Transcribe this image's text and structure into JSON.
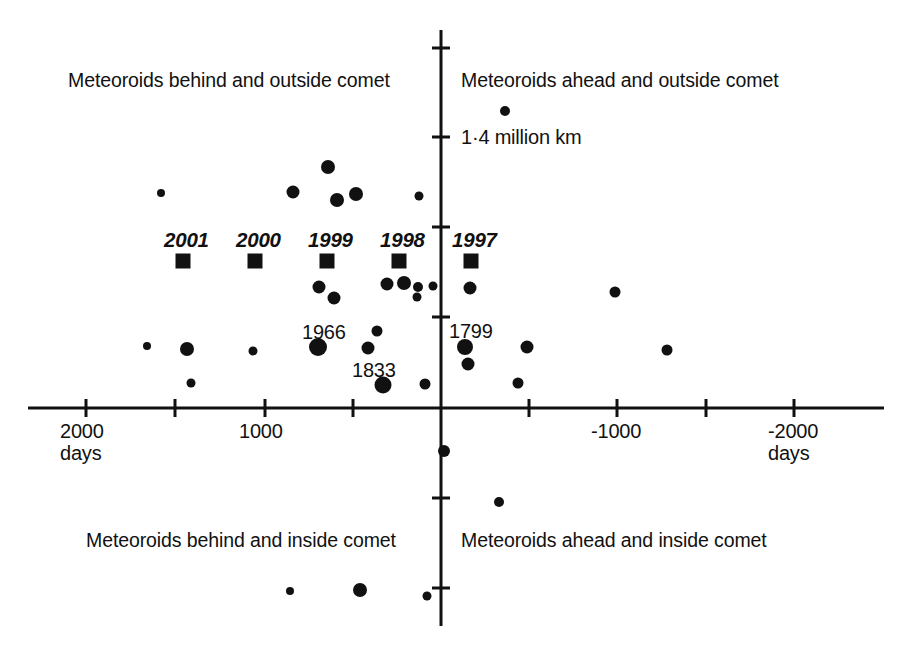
{
  "chart_data": {
    "type": "scatter",
    "title": "",
    "xlabel": "days",
    "ylabel": "",
    "grid": false,
    "legend": "none",
    "xlim": [
      2500,
      -2500
    ],
    "ylim": [
      -2000,
      2050
    ],
    "axis_note": "x axis increases to the left (days behind comet); y axis vertical with tick spacing labelled 1.4 million km",
    "x_ticks": [
      {
        "value": 2000,
        "label": "2000",
        "sublabel": "days",
        "px": 86
      },
      {
        "value": 1500,
        "label": "",
        "sublabel": "",
        "px": 175
      },
      {
        "value": 1000,
        "label": "1000",
        "sublabel": "",
        "px": 265
      },
      {
        "value": 500,
        "label": "",
        "sublabel": "",
        "px": 353
      },
      {
        "value": 0,
        "label": "",
        "sublabel": "",
        "px": 441
      },
      {
        "value": -500,
        "label": "",
        "sublabel": "",
        "px": 529
      },
      {
        "value": -1000,
        "label": "-1000",
        "sublabel": "",
        "px": 617
      },
      {
        "value": -1500,
        "label": "",
        "sublabel": "",
        "px": 706
      },
      {
        "value": -2000,
        "label": "-2000",
        "sublabel": "days",
        "px": 794
      }
    ],
    "y_ticks": [
      {
        "px": 48,
        "label": ""
      },
      {
        "px": 137,
        "label": "1·4 million km"
      },
      {
        "px": 227,
        "label": ""
      },
      {
        "px": 317,
        "label": ""
      },
      {
        "px": 408,
        "label": ""
      },
      {
        "px": 498,
        "label": ""
      },
      {
        "px": 588,
        "label": ""
      }
    ],
    "y_tick_spacing_label": "1·4 million km",
    "quadrant_labels": [
      {
        "id": "behind-outside",
        "text": "Meteoroids behind and outside comet",
        "x_px": 68,
        "y_px": 70
      },
      {
        "id": "ahead-outside",
        "text": "Meteoroids ahead and outside comet",
        "x_px": 461,
        "y_px": 70
      },
      {
        "id": "behind-inside",
        "text": "Meteoroids behind and inside comet",
        "x_px": 86,
        "y_px": 530
      },
      {
        "id": "ahead-inside",
        "text": "Meteoroids ahead and inside comet",
        "x_px": 461,
        "y_px": 530
      }
    ],
    "series": [
      {
        "name": "dust trails",
        "marker": "circle",
        "color": "#111111",
        "points": [
          {
            "x_px": 161,
            "y_px": 193,
            "r": 4.0
          },
          {
            "x_px": 293,
            "y_px": 192,
            "r": 6.5
          },
          {
            "x_px": 328,
            "y_px": 167,
            "r": 7.0
          },
          {
            "x_px": 337,
            "y_px": 200,
            "r": 7.0
          },
          {
            "x_px": 356,
            "y_px": 194,
            "r": 7.0
          },
          {
            "x_px": 419,
            "y_px": 196,
            "r": 4.5
          },
          {
            "x_px": 505,
            "y_px": 111,
            "r": 5.0
          },
          {
            "x_px": 319,
            "y_px": 287,
            "r": 6.5
          },
          {
            "x_px": 334,
            "y_px": 298,
            "r": 6.5
          },
          {
            "x_px": 387,
            "y_px": 284,
            "r": 6.5
          },
          {
            "x_px": 404,
            "y_px": 283,
            "r": 7.0
          },
          {
            "x_px": 418,
            "y_px": 287,
            "r": 5.0
          },
          {
            "x_px": 417,
            "y_px": 297,
            "r": 4.5
          },
          {
            "x_px": 433,
            "y_px": 286,
            "r": 4.5
          },
          {
            "x_px": 470,
            "y_px": 288,
            "r": 6.5
          },
          {
            "x_px": 615,
            "y_px": 292,
            "r": 5.5
          },
          {
            "x_px": 147,
            "y_px": 346,
            "r": 4.0
          },
          {
            "x_px": 187,
            "y_px": 349,
            "r": 7.0
          },
          {
            "x_px": 253,
            "y_px": 351,
            "r": 4.5
          },
          {
            "x_px": 191,
            "y_px": 383,
            "r": 4.5
          },
          {
            "x_px": 318,
            "y_px": 347,
            "r": 9.0
          },
          {
            "x_px": 377,
            "y_px": 331,
            "r": 5.5
          },
          {
            "x_px": 368,
            "y_px": 348,
            "r": 6.5
          },
          {
            "x_px": 383,
            "y_px": 385,
            "r": 8.5
          },
          {
            "x_px": 425,
            "y_px": 384,
            "r": 5.5
          },
          {
            "x_px": 465,
            "y_px": 347,
            "r": 8.0
          },
          {
            "x_px": 468,
            "y_px": 364,
            "r": 6.5
          },
          {
            "x_px": 527,
            "y_px": 347,
            "r": 6.5
          },
          {
            "x_px": 667,
            "y_px": 350,
            "r": 5.5
          },
          {
            "x_px": 518,
            "y_px": 383,
            "r": 5.5
          },
          {
            "x_px": 444,
            "y_px": 451,
            "r": 6.0
          },
          {
            "x_px": 499,
            "y_px": 502,
            "r": 5.0
          },
          {
            "x_px": 290,
            "y_px": 591,
            "r": 4.0
          },
          {
            "x_px": 360,
            "y_px": 590,
            "r": 7.0
          },
          {
            "x_px": 427,
            "y_px": 596,
            "r": 4.5
          }
        ]
      },
      {
        "name": "comet perihelion returns",
        "marker": "square",
        "color": "#111111",
        "points": [
          {
            "label": "2001",
            "x_px": 183,
            "y_px": 261,
            "size": 15
          },
          {
            "label": "2000",
            "x_px": 255,
            "y_px": 261,
            "size": 15
          },
          {
            "label": "1999",
            "x_px": 327,
            "y_px": 261,
            "size": 15
          },
          {
            "label": "1998",
            "x_px": 399,
            "y_px": 261,
            "size": 15
          },
          {
            "label": "1997",
            "x_px": 471,
            "y_px": 261,
            "size": 15
          }
        ]
      }
    ],
    "year_labels": [
      {
        "text": "2001",
        "x_px": 164,
        "y_px": 229
      },
      {
        "text": "2000",
        "x_px": 236,
        "y_px": 229
      },
      {
        "text": "1999",
        "x_px": 308,
        "y_px": 229
      },
      {
        "text": "1998",
        "x_px": 380,
        "y_px": 229
      },
      {
        "text": "1997",
        "x_px": 452,
        "y_px": 229
      }
    ],
    "annotations": [
      {
        "text": "1966",
        "x_px": 302,
        "y_px": 321
      },
      {
        "text": "1833",
        "x_px": 352,
        "y_px": 359
      },
      {
        "text": "1799",
        "x_px": 449,
        "y_px": 320
      },
      {
        "text": "1·4 million km",
        "x_px": 461,
        "y_px": 126
      }
    ]
  },
  "axis": {
    "x_axis_y_px": 408,
    "y_axis_x_px": 441,
    "x_start_px": 28,
    "x_end_px": 884,
    "y_start_px": 30,
    "y_end_px": 626,
    "stroke": "#111111",
    "stroke_width": 3,
    "tick_len": 9
  }
}
